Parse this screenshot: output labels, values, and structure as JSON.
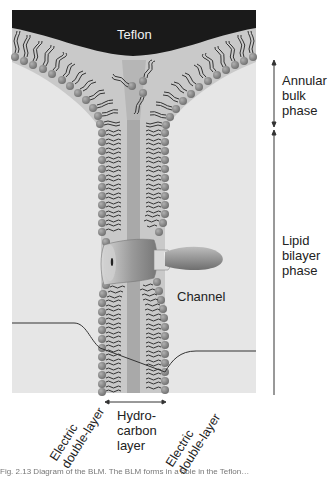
{
  "figure": {
    "teflon_label": "Teflon",
    "channel_label": "Channel",
    "phases": [
      {
        "id": "annular",
        "label_lines": [
          "Annular",
          "bulk",
          "phase"
        ]
      },
      {
        "id": "bilayer",
        "label_lines": [
          "Lipid",
          "bilayer",
          "phase"
        ]
      }
    ],
    "bottom_labels": {
      "left_edl": [
        "Electric",
        "double-layer"
      ],
      "hydrocarbon": [
        "Hydro-",
        "carbon",
        "layer"
      ],
      "right_edl": [
        "Electric",
        "double-layer"
      ]
    },
    "caption": "Fig. 2.13  Diagram of the BLM. The BLM forms in a hole in the Teflon…"
  },
  "colors": {
    "teflon": "#1a1a1a",
    "aqueous": "#e6e6e6",
    "annulus": "#c9c9c9",
    "hydrocarbon_core": "#a9a9a9",
    "lipid_head": "#8a8a8a",
    "lipid_tail": "#333333",
    "channel": "#9a9a9a",
    "potential_line": "#333333"
  }
}
